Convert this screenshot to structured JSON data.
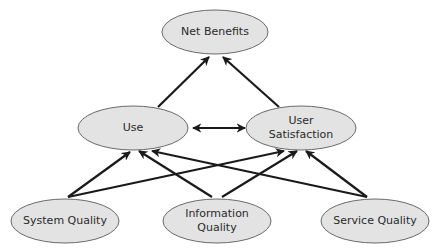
{
  "diagram": {
    "title": "",
    "nodes": [
      {
        "id": "net_benefits",
        "lines": [
          "Net Benefits"
        ]
      },
      {
        "id": "use",
        "lines": [
          "Use"
        ]
      },
      {
        "id": "user_satisfaction",
        "lines": [
          "User",
          "Satisfaction"
        ]
      },
      {
        "id": "system_quality",
        "lines": [
          "System Quality"
        ]
      },
      {
        "id": "information_quality",
        "lines": [
          "Information",
          "Quality"
        ]
      },
      {
        "id": "service_quality",
        "lines": [
          "Service Quality"
        ]
      }
    ],
    "edges": [
      {
        "from": "use",
        "to": "net_benefits",
        "direction": "forward"
      },
      {
        "from": "user_satisfaction",
        "to": "net_benefits",
        "direction": "forward"
      },
      {
        "from": "use",
        "to": "user_satisfaction",
        "direction": "bidirectional"
      },
      {
        "from": "system_quality",
        "to": "use",
        "direction": "forward"
      },
      {
        "from": "system_quality",
        "to": "user_satisfaction",
        "direction": "forward"
      },
      {
        "from": "information_quality",
        "to": "use",
        "direction": "forward"
      },
      {
        "from": "information_quality",
        "to": "user_satisfaction",
        "direction": "forward"
      },
      {
        "from": "service_quality",
        "to": "use",
        "direction": "forward"
      },
      {
        "from": "service_quality",
        "to": "user_satisfaction",
        "direction": "forward"
      }
    ],
    "colors": {
      "node_fill": "#e3e3e3",
      "node_stroke": "#6a6a6a",
      "edge": "#1a1a1a",
      "text": "#2a2a2a"
    }
  }
}
